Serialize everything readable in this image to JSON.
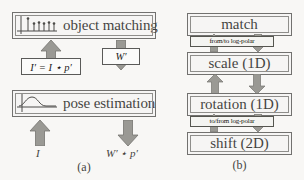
{
  "figure": {
    "panel_a": {
      "caption": "(a)",
      "boxes": [
        {
          "id": "object-matching",
          "label": "object matching",
          "icon": "point-cloud-axes-icon"
        },
        {
          "id": "pose-estimation",
          "label": "pose estimation",
          "icon": "curve-plot-axes-icon"
        }
      ],
      "formulas": [
        {
          "id": "i-prime",
          "text": "I′ = I ⋆ p′"
        },
        {
          "id": "w-prime",
          "text": "W′"
        }
      ],
      "io_labels": [
        {
          "id": "input-I",
          "text": "I"
        },
        {
          "id": "output-Wp",
          "text": "W′ ⋆ p′"
        }
      ],
      "arrows": [
        {
          "id": "arrow-up-left",
          "direction": "up"
        },
        {
          "id": "arrow-down-right",
          "direction": "down"
        },
        {
          "id": "arrow-input-up",
          "direction": "up"
        },
        {
          "id": "arrow-output-down",
          "direction": "down"
        }
      ]
    },
    "panel_b": {
      "caption": "(b)",
      "stages": [
        {
          "id": "match",
          "label": "match"
        },
        {
          "id": "scale",
          "label": "scale (1D)"
        },
        {
          "id": "rotation",
          "label": "rotation (1D)"
        },
        {
          "id": "shift",
          "label": "shift (2D)"
        }
      ],
      "transform_labels": [
        {
          "id": "from-to-log-polar",
          "text": "from/to log-polar"
        },
        {
          "id": "to-from-log-polar",
          "text": "to/from log-polar"
        }
      ],
      "arrows": [
        {
          "id": "match-scale-up",
          "direction": "up"
        },
        {
          "id": "match-scale-down",
          "direction": "down"
        },
        {
          "id": "scale-rotation-up",
          "direction": "up"
        },
        {
          "id": "scale-rotation-down",
          "direction": "down"
        },
        {
          "id": "rotation-shift-up",
          "direction": "up"
        },
        {
          "id": "rotation-shift-down",
          "direction": "down"
        }
      ]
    }
  },
  "colors": {
    "arrow_fill": "#8a8a86",
    "arrow_stroke": "#5d5d59",
    "box_border": "#5a5a58",
    "box_background": "#fbfbfa",
    "page_background": "#fdfdfc",
    "text": "#1d1d1c"
  }
}
